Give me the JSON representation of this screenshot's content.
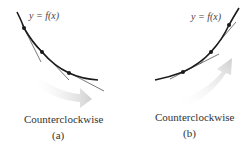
{
  "panels": [
    {
      "id": "a",
      "function_label": "y = f(x)",
      "rotation_label": "Counterclockwise",
      "caption": "(a)",
      "curve_shape": "decreasing, concave up"
    },
    {
      "id": "b",
      "function_label": "y = f(x)",
      "rotation_label": "Counterclockwise",
      "caption": "(b)",
      "curve_shape": "increasing, concave up"
    }
  ],
  "colors": {
    "curve": "#1a1a1a",
    "tangent": "#555555",
    "arrow": "#d9d9d9",
    "text": "#333333"
  }
}
